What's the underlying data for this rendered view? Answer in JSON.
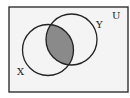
{
  "diagram": {
    "type": "venn",
    "universe_label": "U",
    "sets": [
      {
        "name": "X",
        "label": "X"
      },
      {
        "name": "Y",
        "label": "Y"
      }
    ],
    "shaded_region": "X ∩ Y",
    "colors": {
      "stroke": "#222222",
      "shade": "#8a8a8a",
      "background": "#f4f4f4"
    }
  }
}
